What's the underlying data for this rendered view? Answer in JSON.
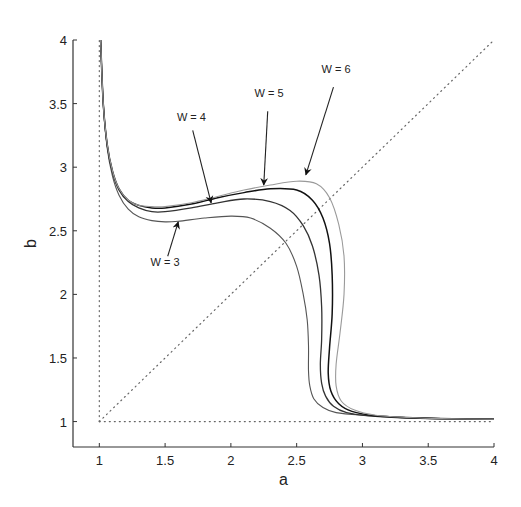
{
  "chart_data": {
    "type": "line",
    "title": "",
    "xlabel": "a",
    "ylabel": "b",
    "xlim": [
      0.8,
      4
    ],
    "ylim": [
      0.8,
      4
    ],
    "xticks": [
      1,
      1.5,
      2,
      2.5,
      3,
      3.5,
      4
    ],
    "xtick_labels": [
      "1",
      "1.5",
      "2",
      "2.5",
      "3",
      "3.5",
      "4"
    ],
    "yticks": [
      1,
      1.5,
      2,
      2.5,
      3,
      3.5,
      4
    ],
    "ytick_labels": [
      "1",
      "1.5",
      "2",
      "2.5",
      "3",
      "3.5",
      "4"
    ],
    "grid": false,
    "legend": "none",
    "reference_lines": [
      {
        "name": "diagonal b = a",
        "style": "dotted",
        "x": [
          1,
          4
        ],
        "y": [
          1,
          4
        ]
      },
      {
        "name": "vertical a = 1",
        "style": "dotted",
        "x": [
          1,
          1
        ],
        "y": [
          1,
          4
        ]
      },
      {
        "name": "horizontal b = 1",
        "style": "dotted",
        "x": [
          1,
          4
        ],
        "y": [
          1,
          1
        ]
      }
    ],
    "series": [
      {
        "name": "W = 3",
        "color": "#555555",
        "width": 1.1,
        "x": [
          1.01,
          1.03,
          1.06,
          1.1,
          1.15,
          1.22,
          1.3,
          1.4,
          1.5,
          1.6,
          1.8,
          2.0,
          2.15,
          2.3,
          2.42,
          2.5,
          2.55,
          2.58,
          2.59,
          2.59,
          2.6,
          2.63,
          2.7,
          2.8,
          3.0,
          3.3,
          3.6,
          4.0
        ],
        "y": [
          4.0,
          3.5,
          3.15,
          2.93,
          2.78,
          2.67,
          2.61,
          2.58,
          2.57,
          2.575,
          2.6,
          2.615,
          2.6,
          2.52,
          2.4,
          2.22,
          2.0,
          1.8,
          1.6,
          1.4,
          1.28,
          1.18,
          1.11,
          1.07,
          1.05,
          1.035,
          1.025,
          1.02
        ]
      },
      {
        "name": "W = 4",
        "color": "#333333",
        "width": 1.3,
        "x": [
          1.01,
          1.03,
          1.06,
          1.1,
          1.15,
          1.22,
          1.3,
          1.4,
          1.5,
          1.7,
          1.9,
          2.1,
          2.3,
          2.45,
          2.55,
          2.62,
          2.67,
          2.69,
          2.69,
          2.68,
          2.69,
          2.72,
          2.78,
          2.88,
          3.05,
          3.3,
          3.6,
          4.0
        ],
        "y": [
          4.0,
          3.5,
          3.17,
          2.96,
          2.82,
          2.73,
          2.68,
          2.65,
          2.65,
          2.68,
          2.72,
          2.75,
          2.73,
          2.66,
          2.54,
          2.38,
          2.15,
          1.9,
          1.65,
          1.45,
          1.3,
          1.2,
          1.12,
          1.07,
          1.045,
          1.03,
          1.022,
          1.018
        ]
      },
      {
        "name": "W = 5",
        "color": "#111111",
        "width": 1.5,
        "x": [
          1.01,
          1.03,
          1.06,
          1.1,
          1.15,
          1.22,
          1.3,
          1.4,
          1.5,
          1.7,
          1.9,
          2.1,
          2.3,
          2.5,
          2.62,
          2.7,
          2.75,
          2.77,
          2.77,
          2.75,
          2.74,
          2.76,
          2.82,
          2.92,
          3.1,
          3.35,
          3.6,
          4.0
        ],
        "y": [
          4.0,
          3.5,
          3.18,
          2.97,
          2.83,
          2.74,
          2.7,
          2.68,
          2.68,
          2.71,
          2.76,
          2.8,
          2.83,
          2.82,
          2.74,
          2.6,
          2.4,
          2.15,
          1.85,
          1.58,
          1.38,
          1.24,
          1.14,
          1.08,
          1.045,
          1.03,
          1.022,
          1.018
        ]
      },
      {
        "name": "W = 6",
        "color": "#9a9a9a",
        "width": 1.1,
        "x": [
          1.01,
          1.03,
          1.06,
          1.1,
          1.15,
          1.22,
          1.3,
          1.4,
          1.5,
          1.7,
          1.9,
          2.1,
          2.3,
          2.5,
          2.65,
          2.75,
          2.82,
          2.86,
          2.86,
          2.83,
          2.8,
          2.8,
          2.84,
          2.94,
          3.1,
          3.35,
          3.6,
          4.0
        ],
        "y": [
          4.0,
          3.5,
          3.18,
          2.97,
          2.83,
          2.74,
          2.7,
          2.69,
          2.69,
          2.72,
          2.77,
          2.82,
          2.86,
          2.89,
          2.87,
          2.76,
          2.55,
          2.3,
          2.0,
          1.7,
          1.45,
          1.28,
          1.16,
          1.09,
          1.05,
          1.032,
          1.023,
          1.018
        ]
      }
    ],
    "annotations": [
      {
        "text": "W = 3",
        "text_x": 1.5,
        "text_y": 2.22,
        "arrow_from": [
          1.52,
          2.3
        ],
        "arrow_to": [
          1.6,
          2.57
        ]
      },
      {
        "text": "W = 4",
        "text_x": 1.7,
        "text_y": 3.36,
        "arrow_from": [
          1.71,
          3.29
        ],
        "arrow_to": [
          1.85,
          2.72
        ]
      },
      {
        "text": "W = 5",
        "text_x": 2.29,
        "text_y": 3.55,
        "arrow_from": [
          2.28,
          3.44
        ],
        "arrow_to": [
          2.25,
          2.86
        ]
      },
      {
        "text": "W = 6",
        "text_x": 2.8,
        "text_y": 3.74,
        "arrow_from": [
          2.78,
          3.63
        ],
        "arrow_to": [
          2.57,
          2.94
        ]
      }
    ]
  },
  "frame": {
    "plot_left_px": 73,
    "plot_right_px": 494,
    "plot_top_px": 40,
    "plot_bottom_px": 447
  }
}
